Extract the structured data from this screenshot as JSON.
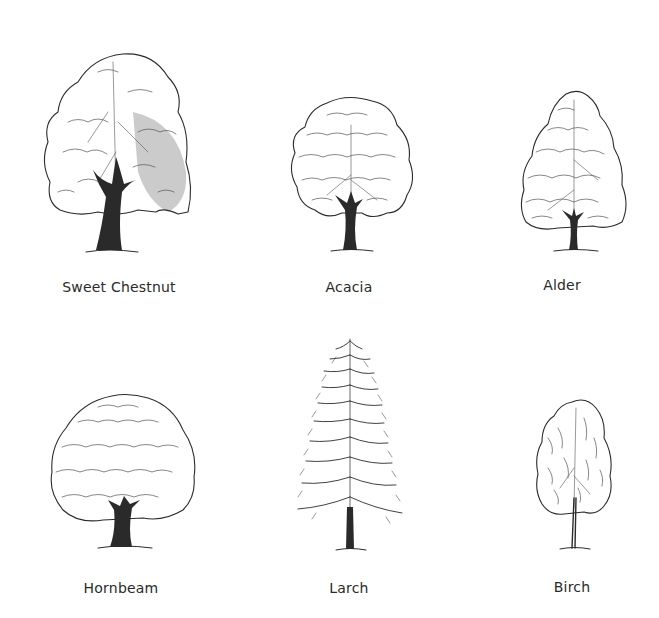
{
  "plate": {
    "trees": [
      {
        "id": "sweet-chestnut",
        "label": "Sweet Chestnut",
        "shape": "broad-irregular"
      },
      {
        "id": "acacia",
        "label": "Acacia",
        "shape": "rounded-layered"
      },
      {
        "id": "alder",
        "label": "Alder",
        "shape": "conical-broad"
      },
      {
        "id": "hornbeam",
        "label": "Hornbeam",
        "shape": "dome"
      },
      {
        "id": "larch",
        "label": "Larch",
        "shape": "narrow-conifer"
      },
      {
        "id": "birch",
        "label": "Birch",
        "shape": "weeping-oval"
      }
    ]
  },
  "colors": {
    "background": "#ffffff",
    "ink": "#2b2b2b",
    "caption": "#2a2a2a"
  }
}
